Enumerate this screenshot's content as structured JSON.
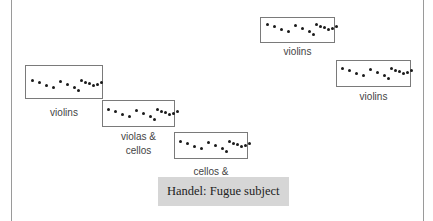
{
  "diagram": {
    "caption": "Handel: Fugue subject",
    "dot_pattern": [
      [
        0,
        0
      ],
      [
        7,
        2
      ],
      [
        14,
        5
      ],
      [
        21,
        7
      ],
      [
        28,
        1
      ],
      [
        35,
        4
      ],
      [
        42,
        7
      ],
      [
        46,
        10
      ],
      [
        49,
        0
      ],
      [
        53,
        2
      ],
      [
        57,
        3
      ],
      [
        61,
        5
      ],
      [
        65,
        4
      ],
      [
        69,
        2
      ]
    ],
    "entries": [
      {
        "id": "violins-1",
        "label": "violins",
        "box": {
          "x": 25,
          "y": 65,
          "w": 78,
          "h": 34
        },
        "dots_origin": {
          "x": 31,
          "y": 79
        },
        "label_pos": {
          "x": 25,
          "y": 106,
          "w": 78
        }
      },
      {
        "id": "violas-cellos",
        "label": "violas &\ncellos",
        "box": {
          "x": 102,
          "y": 100,
          "w": 73,
          "h": 27
        },
        "dots_origin": {
          "x": 107,
          "y": 108
        },
        "label_pos": {
          "x": 102,
          "y": 130,
          "w": 73
        }
      },
      {
        "id": "cellos-basses",
        "label": "cellos &\nbasses",
        "box": {
          "x": 174,
          "y": 132,
          "w": 74,
          "h": 27
        },
        "dots_origin": {
          "x": 179,
          "y": 140
        },
        "label_pos": {
          "x": 174,
          "y": 165,
          "w": 74
        }
      },
      {
        "id": "violins-2",
        "label": "violins",
        "box": {
          "x": 260,
          "y": 17,
          "w": 75,
          "h": 26
        },
        "dots_origin": {
          "x": 266,
          "y": 23
        },
        "label_pos": {
          "x": 260,
          "y": 45,
          "w": 75
        }
      },
      {
        "id": "violins-3",
        "label": "violins",
        "box": {
          "x": 336,
          "y": 60,
          "w": 75,
          "h": 27
        },
        "dots_origin": {
          "x": 341,
          "y": 67
        },
        "label_pos": {
          "x": 336,
          "y": 90,
          "w": 75
        }
      }
    ]
  }
}
